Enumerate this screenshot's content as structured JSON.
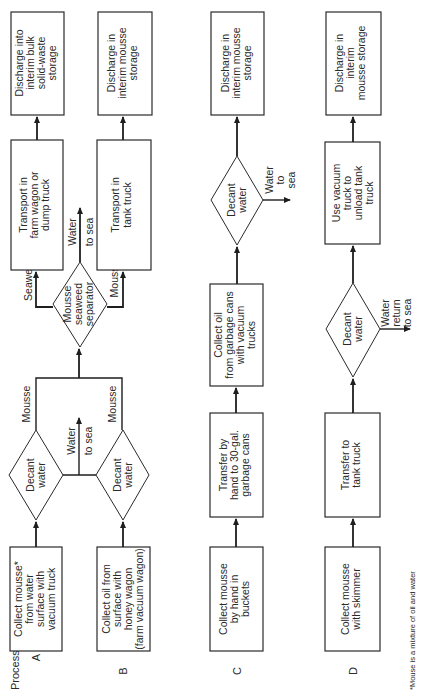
{
  "diagram": {
    "orientation": "rotated-90-ccw",
    "heading": "Process",
    "footnote": "*Mouse is a mixture of oil and water",
    "processes": [
      {
        "id": "A",
        "steps": [
          {
            "lines": [
              "Collect mousse*",
              "from water",
              "surface with",
              "vacuum truck"
            ]
          },
          {
            "lines": [
              "Decant",
              "water"
            ]
          }
        ],
        "edge_label": "Mousse"
      },
      {
        "id": "B",
        "steps": [
          {
            "lines": [
              "Collect oil from",
              "surface with",
              "honey wagon",
              "(farm vacuum wagon)"
            ]
          },
          {
            "lines": [
              "Decant",
              "water"
            ]
          }
        ],
        "edge_label": "Mousse"
      },
      {
        "id": "C",
        "steps": [
          {
            "lines": [
              "Collect mousse",
              "by hand in",
              "buckets"
            ]
          },
          {
            "lines": [
              "Transfer by",
              "hand to 30-gal.",
              "garbage cans"
            ]
          },
          {
            "lines": [
              "Collect oil",
              "from garbage cans",
              "with vacuum",
              "trucks"
            ]
          },
          {
            "lines": [
              "Decant",
              "water"
            ]
          },
          {
            "lines": [
              "Discharge in",
              "interim mousse",
              "storage"
            ]
          }
        ],
        "side_output": [
          "Water",
          "to",
          "sea"
        ]
      },
      {
        "id": "D",
        "steps": [
          {
            "lines": [
              "Collect mousse",
              "with skimmer"
            ]
          },
          {
            "lines": [
              "Transfer to",
              "tank truck"
            ]
          },
          {
            "lines": [
              "Decant",
              "water"
            ]
          },
          {
            "lines": [
              "Use vacuum",
              "truck to",
              "unload tank",
              "truck"
            ]
          },
          {
            "lines": [
              "Discharge in",
              "interim",
              "mousse storage"
            ]
          }
        ],
        "side_output": [
          "Water",
          "return",
          "to sea"
        ]
      }
    ],
    "shared_AB": {
      "water_output": [
        "Water",
        "to sea"
      ],
      "separator": {
        "lines": [
          "Mousse",
          "seaweed",
          "separator"
        ]
      },
      "separator_water_output": [
        "Water",
        "to sea"
      ],
      "seaweed_branch": {
        "label": "Seaweed",
        "transport": {
          "lines": [
            "Transport in",
            "farm wagon or",
            "dump truck"
          ]
        },
        "discharge": {
          "lines": [
            "Discharge into",
            "interim bulk",
            "solid-waste",
            "storage"
          ]
        }
      },
      "mousse_branch": {
        "label": "Mousse",
        "transport": {
          "lines": [
            "Transport in",
            "tank truck"
          ]
        },
        "discharge": {
          "lines": [
            "Discharge in",
            "interim mousse",
            "storage"
          ]
        }
      }
    }
  }
}
